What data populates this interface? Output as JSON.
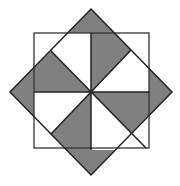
{
  "figure": {
    "colors": {
      "shade": "#808080",
      "stroke": "#222222",
      "background": "#ffffff",
      "thin": "#9a9a9a"
    },
    "square": {
      "x": 34,
      "y": 33,
      "size": 115
    },
    "diamond": [
      [
        91,
        9
      ],
      [
        172,
        92
      ],
      [
        91,
        175
      ],
      [
        10,
        92
      ]
    ],
    "center": [
      91,
      92
    ],
    "shaded_regions": [
      [
        [
          67,
          33
        ],
        [
          91,
          9
        ],
        [
          131,
          50
        ],
        [
          91,
          92
        ],
        [
          91,
          33
        ]
      ],
      [
        [
          149,
          68
        ],
        [
          172,
          92
        ],
        [
          131,
          133
        ],
        [
          91,
          92
        ],
        [
          149,
          92
        ]
      ],
      [
        [
          115,
          150
        ],
        [
          91,
          175
        ],
        [
          51,
          134
        ],
        [
          91,
          92
        ],
        [
          91,
          150
        ]
      ],
      [
        [
          34,
          116
        ],
        [
          10,
          92
        ],
        [
          51,
          51
        ],
        [
          91,
          92
        ],
        [
          34,
          92
        ]
      ]
    ]
  }
}
